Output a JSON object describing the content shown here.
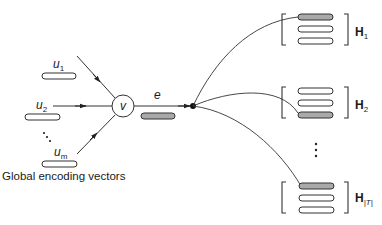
{
  "diagram": {
    "caption": "Global encoding vectors",
    "inputs": [
      {
        "label": "u",
        "sub": "1"
      },
      {
        "label": "u",
        "sub": "2"
      },
      {
        "label": "u",
        "sub": "m"
      }
    ],
    "input_ellipsis": "⋮",
    "node": {
      "label": "v"
    },
    "edge": {
      "label": "e"
    },
    "outputs": [
      {
        "label": "H",
        "sub": "1",
        "highlight_row": 0
      },
      {
        "label": "H",
        "sub": "2",
        "highlight_row": 2
      },
      {
        "label": "H",
        "sub": "|T|",
        "highlight_row": 0
      }
    ],
    "output_ellipsis": "⋮",
    "colors": {
      "stroke": "#333333",
      "highlight_fill": "#a9a9a9",
      "empty_fill": "#ffffff"
    }
  }
}
